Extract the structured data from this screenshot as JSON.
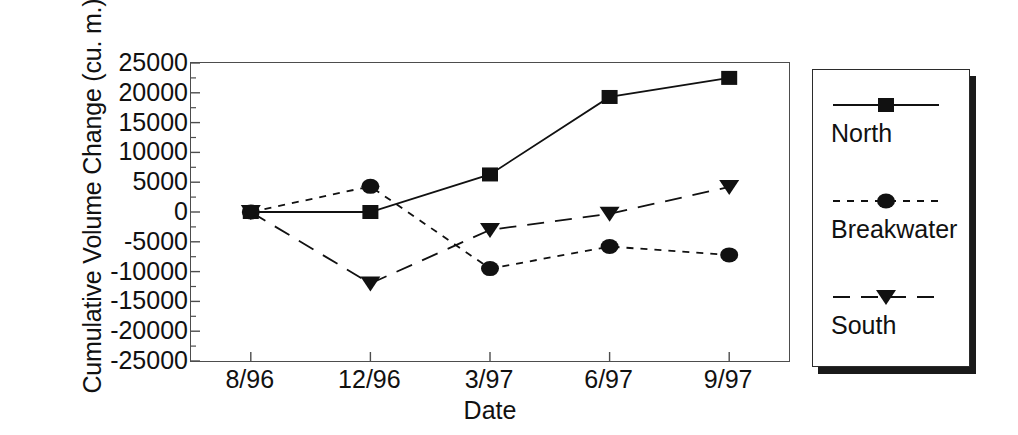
{
  "chart_data": {
    "type": "line",
    "title": "",
    "xlabel": "Date",
    "ylabel": "Cumulative Volume Change (cu. m.)",
    "categories": [
      "8/96",
      "12/96",
      "3/97",
      "6/97",
      "9/97"
    ],
    "ylim": [
      -25000,
      25000
    ],
    "ytick_step": 5000,
    "yticks": [
      "25000",
      "20000",
      "15000",
      "10000",
      "5000",
      "0",
      "-5000",
      "-10000",
      "-15000",
      "-20000",
      "-25000"
    ],
    "ytick_values": [
      25000,
      20000,
      15000,
      10000,
      5000,
      0,
      -5000,
      -10000,
      -15000,
      -20000,
      -25000
    ],
    "grid": false,
    "minor_ticks": true,
    "legend_position": "right",
    "series": [
      {
        "name": "North",
        "marker": "square",
        "line_style": "solid",
        "color": "#111111",
        "values": [
          0,
          0,
          6300,
          19300,
          22500
        ]
      },
      {
        "name": "Breakwater",
        "marker": "circle",
        "line_style": "dashed-short",
        "color": "#111111",
        "values": [
          0,
          4300,
          -9500,
          -5800,
          -7200
        ]
      },
      {
        "name": "South",
        "marker": "triangle-down",
        "line_style": "dashed-long",
        "color": "#111111",
        "values": [
          0,
          -12000,
          -3000,
          -300,
          4200
        ]
      }
    ]
  },
  "legend": {
    "entries": [
      {
        "label": "North"
      },
      {
        "label": "Breakwater"
      },
      {
        "label": "South"
      }
    ]
  },
  "colors": {
    "ink": "#111111",
    "axis": "#4d4d4d",
    "legend_border": "#2b2b2b",
    "legend_shadow": "#1a1a1a",
    "background": "#ffffff"
  }
}
